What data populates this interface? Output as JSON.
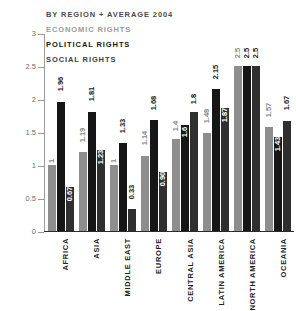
{
  "chart_data": {
    "type": "bar",
    "title": "BY REGION + AVERAGE 2004",
    "xlabel": "",
    "ylabel": "",
    "ylim": [
      0,
      3
    ],
    "yticks": [
      "0",
      "0.5",
      "1",
      "1.5",
      "2",
      "2.5",
      "3"
    ],
    "grid": false,
    "legend_position": "top-left",
    "categories": [
      "AFRICA",
      "ASIA",
      "MIDDLE EAST",
      "EUROPE",
      "CENTRAL ASIA",
      "LATIN AMERICA",
      "NORTH AMERICA",
      "OCEANIA"
    ],
    "series": [
      {
        "name": "ECONOMIC RIGHTS",
        "color": "#8e8e8e",
        "values": [
          1,
          1.19,
          1,
          1.14,
          1.4,
          1.48,
          2.5,
          1.57
        ],
        "labels": [
          "1",
          "1.19",
          "1",
          "1.14",
          "1.4",
          "1.48",
          "2.5",
          "1.57"
        ]
      },
      {
        "name": "POLITICAL RIGHTS",
        "color": "#161616",
        "values": [
          1.96,
          1.81,
          1.33,
          1.68,
          1.6,
          2.15,
          2.5,
          1.43
        ],
        "labels": [
          "1.96",
          "1.81",
          "1.33",
          "1.68",
          "1.6",
          "2.15",
          "2.5",
          "1.43"
        ]
      },
      {
        "name": "SOCIAL RIGHTS",
        "color": "#2f2f2f",
        "values": [
          0.67,
          1.23,
          0.33,
          0.9,
          1.8,
          1.87,
          2.5,
          1.67
        ],
        "labels": [
          "0.67",
          "1.23",
          "0.33",
          "0.90",
          "1.8",
          "1.87",
          "2.5",
          "1.67"
        ]
      }
    ]
  },
  "legend": {
    "title": "BY REGION + AVERAGE 2004",
    "items": [
      {
        "label": "ECONOMIC RIGHTS",
        "color": "#9a9a9a"
      },
      {
        "label": "POLITICAL RIGHTS",
        "color": "#161616"
      },
      {
        "label": "SOCIAL RIGHTS",
        "color": "#3d3d3d"
      }
    ]
  }
}
